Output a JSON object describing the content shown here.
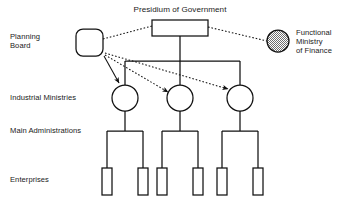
{
  "diagram": {
    "title": "Presidium of Government",
    "nodes": {
      "presidium": {
        "label": "Presidium of Government",
        "shape": "rectangle",
        "fill": "#ffffff"
      },
      "planning_board": {
        "label": "Planning\nBoard",
        "line1": "Planning",
        "line2": "Board",
        "shape": "rounded-square",
        "fill": "#ffffff"
      },
      "functional_ministry": {
        "line1": "Functional",
        "line2": "Ministry",
        "line3": "of Finance",
        "shape": "circle",
        "fill": "hatched"
      }
    },
    "row_labels": {
      "industrial_ministries": "Industrial Ministries",
      "main_administrations": "Main Administrations",
      "enterprises": "Enterprises"
    },
    "counts": {
      "industrial_ministries": 3,
      "main_administrations": 3,
      "enterprises": 6
    },
    "colors": {
      "stroke": "#111111",
      "text": "#1a1a1a",
      "background": "#ffffff",
      "hatch": "#7d7d7d"
    },
    "link_styles": {
      "planning_to_presidium": "dotted",
      "presidium_to_functional_ministry": "dotted",
      "planning_to_ministries": "dotted-arrow",
      "presidium_to_ministries": "solid",
      "ministries_to_administrations": "solid",
      "administrations_to_enterprises": "solid"
    }
  }
}
